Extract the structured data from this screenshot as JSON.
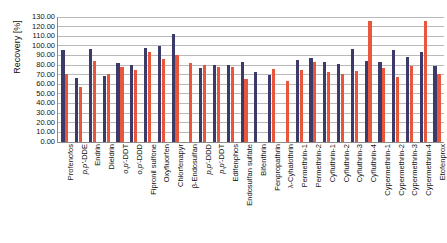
{
  "chart_data": {
    "type": "bar",
    "title": "",
    "xlabel": "",
    "ylabel": "Recovery [%]",
    "ylim": [
      0,
      130
    ],
    "ytick_step": 10,
    "ytick_labels": [
      "130.00",
      "120.00",
      "110.00",
      "100.00",
      "90.00",
      "80.00",
      "70.00",
      "60.00",
      "50.00",
      "40.00",
      "30.00",
      "20.00",
      "10.00",
      "0.00"
    ],
    "grid": true,
    "legend": "none",
    "categories": [
      "Profenofos",
      "p,p'-DDE",
      "Endrin",
      "Dieldrin",
      "o,p'-DDT",
      "o,p'-DDD",
      "Fipronil sulfone",
      "Oxyfluorfen",
      "Chlorfenapyr",
      "β-Endosulfan",
      "p,p'-DDD",
      "p,p'-DDT",
      "Edifenphos",
      "Endosulfan sulfate",
      "Bifenthrin",
      "Fenpropathrin",
      "λ-Cyhalothrin",
      "Permethrin-1",
      "Permethrin-2",
      "Cyfluthrin-1",
      "Cyfluthrin-2",
      "Cyfluthrin-3",
      "Cyfluthrin-4",
      "Cypermethrin-1",
      "Cypermethrin-2",
      "Cypermethrin-3",
      "Cypermethrin-4",
      "Etofenprox"
    ],
    "series": [
      {
        "name": "series-1",
        "color": "#3b3a69",
        "values": [
          95,
          66,
          96,
          68,
          82,
          80,
          97,
          99,
          112,
          0,
          76,
          80,
          80,
          83,
          72,
          69,
          0,
          85,
          87,
          83,
          81,
          96,
          84,
          83,
          95,
          88,
          93,
          79
        ]
      },
      {
        "name": "series-2",
        "color": "#e8573c",
        "values": [
          70,
          57,
          84,
          70,
          78,
          74,
          93,
          86,
          90,
          82,
          80,
          77,
          78,
          65,
          0,
          75,
          63,
          74,
          83,
          72,
          70,
          73,
          125,
          76,
          67,
          79,
          125,
          70
        ]
      }
    ]
  }
}
